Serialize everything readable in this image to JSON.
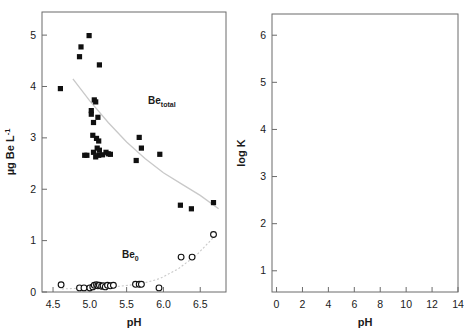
{
  "figure": {
    "panels": [
      "left",
      "right"
    ],
    "background": "#ffffff",
    "trend_color": "#c9c9c9",
    "axis_color": "#6b6b6b",
    "marker_color": "#101010"
  },
  "left_panel": {
    "xlabel": "pH",
    "ylabel_parts": {
      "main": "µg Be L",
      "sup": "-1"
    },
    "xticks": [
      "4.5",
      "5.0",
      "5.5",
      "6.0",
      "6.5"
    ],
    "yticks": [
      "0",
      "1",
      "2",
      "3",
      "4",
      "5"
    ],
    "annotations": [
      {
        "name": "be-total",
        "main": "Be",
        "sub": "total"
      },
      {
        "name": "be-zero",
        "main": "Be",
        "sub": "0"
      }
    ]
  },
  "right_panel": {
    "xlabel": "pH",
    "ylabel_parts": {
      "pre": "log K",
      "sub": "d",
      "sup": "Be",
      "post": " (L kg",
      "post_sup": "-1",
      "post_end": ")"
    },
    "xticks": [
      "0",
      "2",
      "4",
      "6",
      "8",
      "10",
      "12",
      "14"
    ],
    "yticks": [
      "1",
      "2",
      "3",
      "4",
      "5",
      "6"
    ],
    "legend": {
      "items": [
        {
          "marker": "kaolinite-marker",
          "label": "Kaolinite in river water"
        },
        {
          "marker": "illite-marker",
          "label": "Illite in river water"
        },
        {
          "marker": "river-mud-marker",
          "label": "River mud in river water"
        },
        {
          "marker": "suspended-matter-marker",
          "label": "Suspended matter in river"
        }
      ],
      "source_note": "(Vesely, Majer, unpublished)"
    }
  },
  "chart_data": [
    {
      "type": "scatter",
      "id": "left",
      "title": "",
      "xlabel": "pH",
      "ylabel": "µg Be L-1",
      "xlim": [
        4.35,
        6.85
      ],
      "ylim": [
        0,
        5.45
      ],
      "grid": false,
      "legend_position": "inline-annotations",
      "series": [
        {
          "name": "Be total",
          "marker": "filled-square",
          "points": [
            [
              4.6,
              3.96
            ],
            [
              4.86,
              4.58
            ],
            [
              4.88,
              4.77
            ],
            [
              4.99,
              4.99
            ],
            [
              5.13,
              4.42
            ],
            [
              5.06,
              3.74
            ],
            [
              5.08,
              3.7
            ],
            [
              5.02,
              3.53
            ],
            [
              5.02,
              3.46
            ],
            [
              5.11,
              3.4
            ],
            [
              5.05,
              3.3
            ],
            [
              5.04,
              3.05
            ],
            [
              5.09,
              2.99
            ],
            [
              5.12,
              2.94
            ],
            [
              5.1,
              2.8
            ],
            [
              5.05,
              2.72
            ],
            [
              5.13,
              2.76
            ],
            [
              4.93,
              2.66
            ],
            [
              4.96,
              2.66
            ],
            [
              5.12,
              2.66
            ],
            [
              5.17,
              2.67
            ],
            [
              5.22,
              2.72
            ],
            [
              5.25,
              2.69
            ],
            [
              5.28,
              2.68
            ],
            [
              5.08,
              2.63
            ],
            [
              5.63,
              2.56
            ],
            [
              5.67,
              3.01
            ],
            [
              5.7,
              2.8
            ],
            [
              5.95,
              2.68
            ],
            [
              6.23,
              1.69
            ],
            [
              6.38,
              1.62
            ],
            [
              6.68,
              1.74
            ]
          ]
        },
        {
          "name": "Be 0",
          "marker": "open-circle",
          "points": [
            [
              4.61,
              0.14
            ],
            [
              4.86,
              0.08
            ],
            [
              4.92,
              0.08
            ],
            [
              5.0,
              0.08
            ],
            [
              5.04,
              0.1
            ],
            [
              5.06,
              0.13
            ],
            [
              5.09,
              0.14
            ],
            [
              5.11,
              0.12
            ],
            [
              5.13,
              0.13
            ],
            [
              5.16,
              0.11
            ],
            [
              5.18,
              0.12
            ],
            [
              5.21,
              0.1
            ],
            [
              5.24,
              0.13
            ],
            [
              5.28,
              0.12
            ],
            [
              5.32,
              0.13
            ],
            [
              5.62,
              0.15
            ],
            [
              5.67,
              0.15
            ],
            [
              5.7,
              0.15
            ],
            [
              5.94,
              0.08
            ],
            [
              6.24,
              0.68
            ],
            [
              6.39,
              0.68
            ],
            [
              6.68,
              1.12
            ]
          ]
        }
      ],
      "trend_lines": [
        {
          "name": "Be total trend",
          "color": "#c9c9c9"
        },
        {
          "name": "Be 0 trend",
          "color": "#c9c9c9"
        }
      ]
    },
    {
      "type": "scatter",
      "id": "right",
      "title": "",
      "xlabel": "pH",
      "ylabel": "log Kd Be (L kg-1)",
      "xlim": [
        -0.35,
        14
      ],
      "ylim": [
        0.55,
        6.45
      ],
      "grid": false,
      "legend_position": "bottom-right",
      "series": [
        {
          "name": "Kaolinite in river water",
          "marker": "kaolinite",
          "points": [
            [
              0.15,
              1.0
            ],
            [
              1.0,
              1.26
            ],
            [
              1.25,
              1.19
            ],
            [
              3.1,
              2.05
            ],
            [
              3.25,
              3.85
            ],
            [
              5.95,
              4.88
            ],
            [
              6.8,
              5.3
            ],
            [
              7.9,
              5.45
            ],
            [
              7.92,
              5.52
            ],
            [
              8.0,
              5.2
            ],
            [
              11.3,
              5.45
            ],
            [
              12.05,
              4.84
            ],
            [
              12.0,
              4.63
            ],
            [
              10.65,
              4.95
            ],
            [
              6.2,
              4.9
            ]
          ]
        },
        {
          "name": "Illite in river water",
          "marker": "filled-circle",
          "points": [
            [
              1.05,
              1.4
            ],
            [
              2.2,
              1.7
            ],
            [
              3.12,
              2.2
            ],
            [
              4.15,
              3.43
            ],
            [
              6.6,
              5.58
            ],
            [
              7.35,
              5.85
            ],
            [
              10.15,
              5.67
            ],
            [
              10.7,
              5.31
            ],
            [
              11.25,
              5.65
            ]
          ]
        },
        {
          "name": "River mud in river water",
          "marker": "star-circle",
          "points": [
            [
              1.0,
              1.64
            ],
            [
              2.15,
              1.98
            ],
            [
              3.12,
              2.18
            ],
            [
              3.25,
              2.05
            ],
            [
              4.2,
              3.95
            ],
            [
              6.75,
              5.48
            ],
            [
              6.95,
              4.9
            ],
            [
              10.2,
              5.42
            ],
            [
              11.3,
              5.44
            ],
            [
              10.7,
              4.95
            ]
          ]
        },
        {
          "name": "Suspended matter in river",
          "marker": "open-circle",
          "points": [
            [
              3.4,
              3.83
            ],
            [
              3.5,
              4.53
            ],
            [
              4.05,
              4.62
            ],
            [
              4.8,
              3.92
            ],
            [
              4.85,
              4.88
            ],
            [
              5.0,
              5.11
            ],
            [
              5.35,
              4.96
            ],
            [
              5.7,
              4.43
            ],
            [
              6.1,
              4.53
            ],
            [
              6.55,
              5.7
            ],
            [
              6.75,
              5.3
            ],
            [
              7.3,
              5.02
            ],
            [
              7.55,
              5.3
            ],
            [
              7.6,
              4.9
            ],
            [
              7.85,
              5.9
            ],
            [
              8.1,
              5.33
            ],
            [
              8.35,
              5.2
            ],
            [
              8.4,
              4.9
            ],
            [
              6.5,
              5.25
            ]
          ]
        }
      ]
    }
  ]
}
